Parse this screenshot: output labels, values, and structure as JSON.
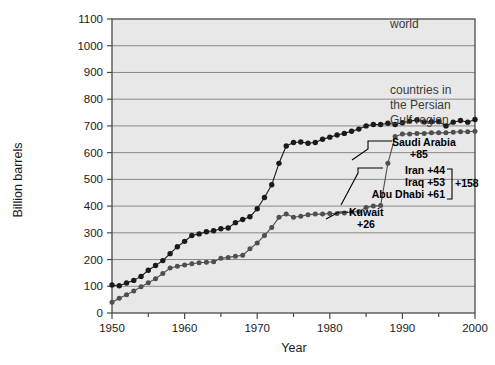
{
  "chart_data": {
    "type": "line",
    "title": "",
    "xlabel": "Year",
    "ylabel": "Billion barrels",
    "xlim": [
      1950,
      2000
    ],
    "ylim": [
      0,
      1100
    ],
    "xticks": [
      1950,
      1960,
      1970,
      1980,
      1990,
      2000
    ],
    "xtick_labels": [
      "1950",
      "1960",
      "1970",
      "1980",
      "1990",
      "2000"
    ],
    "xminor_step": 5,
    "yticks": [
      0,
      100,
      200,
      300,
      400,
      500,
      600,
      700,
      800,
      900,
      1000,
      1100
    ],
    "ytick_labels": [
      "0",
      "100",
      "200",
      "300",
      "400",
      "500",
      "600",
      "700",
      "800",
      "900",
      "1000",
      "1100"
    ],
    "grid": "horizontal",
    "legend_position": "inline-annotations",
    "plot_background": "#e8e8e8",
    "series": [
      {
        "name": "world",
        "color": "#1a1a1a",
        "marker": "filled-circle",
        "x": [
          1950,
          1951,
          1952,
          1953,
          1954,
          1955,
          1956,
          1957,
          1958,
          1959,
          1960,
          1961,
          1962,
          1963,
          1964,
          1965,
          1966,
          1967,
          1968,
          1969,
          1970,
          1971,
          1972,
          1973,
          1974,
          1975,
          1976,
          1977,
          1978,
          1979,
          1980,
          1981,
          1982,
          1983,
          1984,
          1985,
          1986,
          1987,
          1988,
          1989,
          1990,
          1991,
          1992,
          1993,
          1994,
          1995,
          1996,
          1997,
          1998,
          1999,
          2000
        ],
        "values": [
          105,
          102,
          110,
          120,
          133,
          155,
          170,
          190,
          215,
          240,
          265,
          285,
          290,
          300,
          305,
          312,
          315,
          335,
          345,
          355,
          380,
          415,
          460,
          530,
          600,
          625,
          640,
          645,
          645,
          650,
          655,
          660,
          670,
          675,
          680,
          690,
          700,
          705,
          710,
          705,
          710,
          715,
          720,
          715,
          715,
          715,
          700,
          712,
          718,
          713,
          722
        ]
      }
    ],
    "world_series_detail": {
      "note": "world proved reserves; sharp step up 1987-1989",
      "x": [
        1950,
        1951,
        1952,
        1953,
        1954,
        1955,
        1956,
        1957,
        1958,
        1959,
        1960,
        1961,
        1962,
        1963,
        1964,
        1965,
        1966,
        1967,
        1968,
        1969,
        1970,
        1971,
        1972,
        1973,
        1974,
        1975,
        1976,
        1977,
        1978,
        1979,
        1980,
        1981,
        1982,
        1983,
        1984,
        1985,
        1986,
        1987,
        1988,
        1989,
        1990,
        1991,
        1992,
        1993,
        1994,
        1995,
        1996,
        1997,
        1998,
        1999,
        2000
      ],
      "values": [
        105,
        102,
        112,
        122,
        137,
        160,
        178,
        196,
        222,
        248,
        268,
        290,
        296,
        304,
        308,
        315,
        318,
        338,
        350,
        360,
        390,
        432,
        480,
        560,
        625,
        638,
        640,
        635,
        638,
        650,
        658,
        666,
        672,
        680,
        688,
        700,
        705,
        705,
        710,
        705,
        712,
        718,
        722,
        715,
        716,
        716,
        700,
        714,
        720,
        714,
        724
      ]
    },
    "gulf_series": {
      "name": "countries in the Persian Gulf region",
      "color": "#4d4d4d",
      "marker": "filled-circle",
      "x": [
        1950,
        1951,
        1952,
        1953,
        1954,
        1955,
        1956,
        1957,
        1958,
        1959,
        1960,
        1961,
        1962,
        1963,
        1964,
        1965,
        1966,
        1967,
        1968,
        1969,
        1970,
        1971,
        1972,
        1973,
        1974,
        1975,
        1976,
        1977,
        1978,
        1979,
        1980,
        1981,
        1982,
        1983,
        1984,
        1985,
        1986,
        1987,
        1988,
        1989,
        1990,
        1991,
        1992,
        1993,
        1994,
        1995,
        1996,
        1997,
        1998,
        1999,
        2000
      ],
      "values": [
        40,
        55,
        68,
        82,
        98,
        113,
        128,
        148,
        168,
        175,
        180,
        184,
        188,
        190,
        192,
        205,
        208,
        212,
        216,
        240,
        262,
        290,
        320,
        358,
        370,
        358,
        362,
        368,
        370,
        370,
        372,
        372,
        374,
        378,
        380,
        395,
        400,
        402,
        560,
        660,
        670,
        670,
        672,
        672,
        674,
        674,
        674,
        676,
        678,
        678,
        680
      ]
    },
    "annotations": [
      {
        "id": "world-label",
        "text": "world",
        "x": 1990,
        "y": 1045,
        "style": "plain"
      },
      {
        "id": "gulf-label",
        "text": "countries in\nthe Persian\nGulf region",
        "x": 1988,
        "y": 880,
        "style": "plain"
      },
      {
        "id": "saudi-label",
        "text": "Saudi Arabia",
        "sub": "+85",
        "x": 1988,
        "y": 600,
        "style": "bold"
      },
      {
        "id": "iran-label",
        "text": "Iran +44",
        "x": 1988,
        "y": 510,
        "style": "bold"
      },
      {
        "id": "iraq-label",
        "text": "Iraq +53",
        "x": 1988,
        "y": 478,
        "style": "bold"
      },
      {
        "id": "abudhabi-label",
        "text": "Abu Dhabi +61",
        "x": 1988,
        "y": 446,
        "style": "bold"
      },
      {
        "id": "sum-label",
        "text": "+158",
        "x": 1995,
        "y": 478,
        "style": "bold"
      },
      {
        "id": "kuwait-label",
        "text": "Kuwait",
        "sub": "+26",
        "x": 1988,
        "y": 390,
        "style": "bold"
      }
    ]
  },
  "axes": {
    "y_title": "Billion barrels",
    "x_title": "Year",
    "y_ticks": [
      "1100",
      "1000",
      "900",
      "800",
      "700",
      "600",
      "500",
      "400",
      "300",
      "200",
      "100",
      "0"
    ],
    "x_ticks": [
      "1950",
      "1960",
      "1970",
      "1980",
      "1990",
      "2000"
    ]
  },
  "labels": {
    "world": "world",
    "gulf_line1": "countries in",
    "gulf_line2": "the Persian",
    "gulf_line3": "Gulf region",
    "saudi_name": "Saudi Arabia",
    "saudi_value": "+85",
    "iran": "Iran +44",
    "iraq": "Iraq +53",
    "abudhabi": "Abu Dhabi +61",
    "sum": "+158",
    "kuwait_name": "Kuwait",
    "kuwait_value": "+26"
  },
  "colors": {
    "plot_bg": "#e8e8e8",
    "grid": "#8a8a8a",
    "frame": "#4a4a4a",
    "world_line": "#1a1a1a",
    "gulf_line": "#4f4f4f",
    "text": "#1a1a1a",
    "anno_gray": "#3a3a3a"
  }
}
